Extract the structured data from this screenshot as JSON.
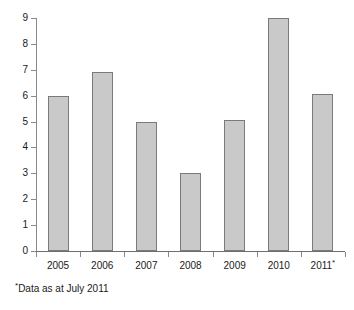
{
  "chart_data": {
    "type": "bar",
    "title": "",
    "subtitle": "",
    "xlabel": "",
    "ylabel": "",
    "categories": [
      "2005",
      "2006",
      "2007",
      "2008",
      "2009",
      "2010",
      "2011*"
    ],
    "values": [
      6,
      6.9,
      5,
      3,
      5.05,
      9,
      6.05
    ],
    "ylim": [
      0,
      9
    ],
    "y_ticks": [
      "0",
      "1",
      "2",
      "3",
      "4",
      "5",
      "6",
      "7",
      "8",
      "9"
    ],
    "grid": false,
    "legend": null,
    "bar_color": "#c9c9c9",
    "bar_border_color": "#7a7a7a",
    "axis_color": "#8a8a8a",
    "annotations": [
      {
        "name": "footnote",
        "marker": "*",
        "text": "Data as at July 2011"
      }
    ]
  },
  "axis": {
    "y_tick_labels": [
      "9",
      "8",
      "7",
      "6",
      "5",
      "4",
      "3",
      "2",
      "1",
      "0"
    ],
    "x_tick_labels": [
      "2005",
      "2006",
      "2007",
      "2008",
      "2009",
      "2010",
      "2011"
    ],
    "x_last_superscript": "*"
  },
  "footnote": {
    "marker": "*",
    "text": "Data as at July 2011"
  }
}
